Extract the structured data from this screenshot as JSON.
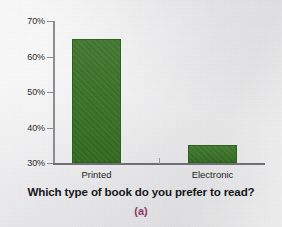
{
  "chart_data": {
    "type": "bar",
    "title": "",
    "xlabel": "Which type of book do you prefer to read?",
    "ylabel": "",
    "categories": [
      "Printed",
      "Electronic"
    ],
    "values": [
      65,
      35
    ],
    "ylim": [
      30,
      70
    ],
    "ytick_labels": [
      "30%",
      "40%",
      "50%",
      "60%",
      "70%"
    ],
    "ytick_values": [
      30,
      40,
      50,
      60,
      70
    ],
    "grid": false,
    "legend": false,
    "bar_color": "#357021",
    "series": [
      {
        "name": "Percent of respondents",
        "values": [
          65,
          35
        ]
      }
    ]
  },
  "figure": {
    "panel_caption": "(a)",
    "panel_caption_color": "#8e3a66",
    "background_color": "#e9e9eb",
    "axis_color": "#8e8e92"
  }
}
